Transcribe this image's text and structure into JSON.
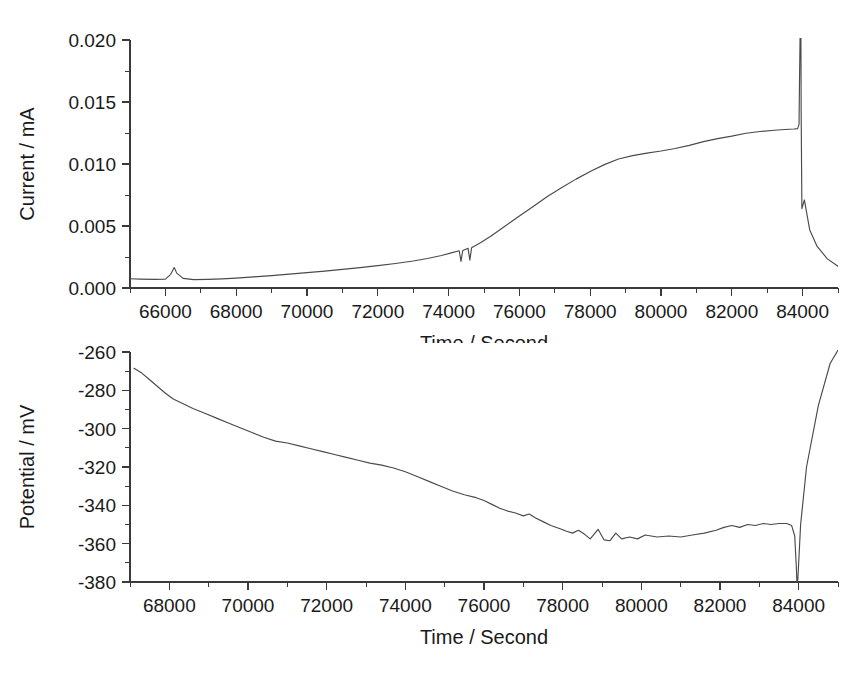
{
  "figure": {
    "background_color": "#ffffff",
    "line_color": "#4a4a4a",
    "axis_color": "#3a3a3a",
    "panel_count": 2
  },
  "chart_data": [
    {
      "id": "current-vs-time",
      "type": "line",
      "title": "",
      "xlabel": "Time / Second",
      "ylabel": "Current / mA",
      "xlim": [
        65000,
        85000
      ],
      "ylim": [
        0.0,
        0.02
      ],
      "grid": false,
      "legend": "none",
      "xticks": [
        66000,
        68000,
        70000,
        72000,
        74000,
        76000,
        78000,
        80000,
        82000,
        84000
      ],
      "xticklabels": [
        "66000",
        "68000",
        "70000",
        "72000",
        "74000",
        "76000",
        "78000",
        "80000",
        "82000",
        "84000"
      ],
      "yticks": [
        0.0,
        0.005,
        0.01,
        0.015,
        0.02
      ],
      "yticklabels": [
        "0.000",
        "0.005",
        "0.010",
        "0.015",
        "0.020"
      ],
      "minor_x_interval": 1000,
      "minor_y_interval": 0.0025,
      "series": [
        {
          "name": "Current",
          "x": [
            65000,
            65300,
            65700,
            66000,
            66150,
            66250,
            66320,
            66500,
            66800,
            67200,
            67600,
            68000,
            68500,
            69000,
            69500,
            70000,
            70500,
            71000,
            71500,
            72000,
            72500,
            73000,
            73400,
            73800,
            74100,
            74300,
            74350,
            74400,
            74550,
            74600,
            74650,
            74900,
            75200,
            75600,
            76000,
            76400,
            76800,
            77200,
            77600,
            78000,
            78400,
            78800,
            79200,
            79600,
            80000,
            80400,
            80800,
            81200,
            81600,
            82000,
            82400,
            82800,
            83200,
            83500,
            83750,
            83860,
            83900,
            83910,
            83930,
            83950,
            83960,
            83980,
            84050,
            84200,
            84400,
            84700,
            85000
          ],
          "y": [
            0.00075,
            0.00072,
            0.0007,
            0.00072,
            0.0011,
            0.00165,
            0.0012,
            0.00078,
            0.00068,
            0.0007,
            0.00074,
            0.0008,
            0.0009,
            0.001,
            0.00112,
            0.00124,
            0.00136,
            0.0015,
            0.00164,
            0.0018,
            0.00198,
            0.00218,
            0.00238,
            0.00262,
            0.00285,
            0.003,
            0.00215,
            0.00302,
            0.0032,
            0.00225,
            0.00325,
            0.00365,
            0.0042,
            0.005,
            0.0058,
            0.0066,
            0.0074,
            0.0081,
            0.00878,
            0.0094,
            0.00995,
            0.0104,
            0.01068,
            0.01088,
            0.01105,
            0.01125,
            0.0115,
            0.0118,
            0.01205,
            0.01225,
            0.01248,
            0.01262,
            0.01272,
            0.01278,
            0.01282,
            0.01285,
            0.0132,
            0.016,
            0.0205,
            0.022,
            0.014,
            0.0064,
            0.0071,
            0.0047,
            0.0034,
            0.00235,
            0.00175
          ]
        }
      ],
      "annotations": [
        {
          "text": "small current spike",
          "x": 66250,
          "y": 0.00165
        },
        {
          "text": "downward noise notches",
          "x": 74400,
          "y": 0.0022
        },
        {
          "text": "terminal spike clipped above axis",
          "x": 83930,
          "y": 0.0205
        }
      ]
    },
    {
      "id": "potential-vs-time",
      "type": "line",
      "title": "",
      "xlabel": "Time / Second",
      "ylabel": "Potential / mV",
      "xlim": [
        67000,
        85000
      ],
      "ylim": [
        -380,
        -260
      ],
      "grid": false,
      "legend": "none",
      "xticks": [
        68000,
        70000,
        72000,
        74000,
        76000,
        78000,
        80000,
        82000,
        84000
      ],
      "xticklabels": [
        "68000",
        "70000",
        "72000",
        "74000",
        "76000",
        "78000",
        "80000",
        "82000",
        "84000"
      ],
      "yticks": [
        -380,
        -360,
        -340,
        -320,
        -300,
        -280,
        -260
      ],
      "yticklabels": [
        "-380",
        "-360",
        "-340",
        "-320",
        "-300",
        "-280",
        "-260"
      ],
      "minor_x_interval": 1000,
      "minor_y_interval": 10,
      "series": [
        {
          "name": "Potential",
          "x": [
            67100,
            67300,
            67500,
            67700,
            67900,
            68100,
            68350,
            68600,
            68900,
            69200,
            69500,
            69800,
            70100,
            70400,
            70700,
            71000,
            71300,
            71600,
            71900,
            72200,
            72500,
            72800,
            73100,
            73400,
            73700,
            74000,
            74300,
            74600,
            74900,
            75200,
            75500,
            75800,
            76000,
            76200,
            76400,
            76600,
            76800,
            77000,
            77150,
            77300,
            77500,
            77700,
            77900,
            78100,
            78250,
            78400,
            78550,
            78700,
            78900,
            79050,
            79200,
            79350,
            79500,
            79700,
            79900,
            80100,
            80400,
            80700,
            81000,
            81300,
            81600,
            81900,
            82100,
            82300,
            82500,
            82700,
            82900,
            83100,
            83300,
            83500,
            83700,
            83820,
            83900,
            83940,
            83960,
            83980,
            84050,
            84200,
            84500,
            84800,
            85000
          ],
          "y": [
            -268.5,
            -271.0,
            -274.5,
            -278.0,
            -281.5,
            -284.5,
            -287.0,
            -289.5,
            -292.0,
            -294.5,
            -297.0,
            -299.5,
            -302.0,
            -304.5,
            -306.5,
            -307.5,
            -309.0,
            -310.5,
            -312.0,
            -313.5,
            -315.0,
            -316.5,
            -318.0,
            -319.0,
            -320.5,
            -322.5,
            -325.0,
            -327.5,
            -330.0,
            -332.5,
            -334.5,
            -336.0,
            -337.5,
            -339.5,
            -341.5,
            -343.0,
            -344.0,
            -345.5,
            -344.5,
            -346.5,
            -348.5,
            -350.5,
            -352.0,
            -353.5,
            -354.5,
            -353.0,
            -355.0,
            -357.5,
            -352.5,
            -358.0,
            -358.5,
            -354.5,
            -357.5,
            -356.5,
            -357.5,
            -355.5,
            -356.5,
            -356.0,
            -356.5,
            -355.5,
            -354.5,
            -353.0,
            -351.5,
            -350.5,
            -351.5,
            -350.0,
            -350.5,
            -349.5,
            -350.0,
            -349.5,
            -349.5,
            -350.5,
            -356.0,
            -372.0,
            -382.5,
            -378.0,
            -350.0,
            -320.0,
            -288.0,
            -266.0,
            -259.0
          ]
        }
      ],
      "annotations": [
        {
          "text": "oscillation peaks",
          "x": 78400,
          "y": -353.0
        },
        {
          "text": "sharp potential drop then rise",
          "x": 83950,
          "y": -382.5
        }
      ]
    }
  ]
}
